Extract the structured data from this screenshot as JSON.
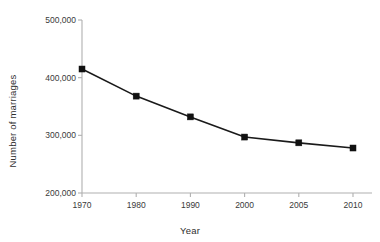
{
  "chart_data": {
    "type": "line",
    "title": "",
    "xlabel": "Year",
    "ylabel": "Number of marriages",
    "categories": [
      "1970",
      "1980",
      "1990",
      "2000",
      "2005",
      "2010"
    ],
    "values": [
      415000,
      368000,
      332000,
      297000,
      287000,
      278000
    ],
    "series": [
      {
        "name": "Number of marriages",
        "values": [
          415000,
          368000,
          332000,
          297000,
          287000,
          278000
        ]
      }
    ],
    "ylim": [
      200000,
      500000
    ],
    "yticks": [
      200000,
      300000,
      400000,
      500000
    ],
    "ytick_labels": [
      "200,000",
      "300,000",
      "400,000",
      "500,000"
    ],
    "xtick_labels": [
      "1970",
      "1980",
      "1990",
      "2000",
      "2005",
      "2010"
    ],
    "grid": false,
    "legend": false,
    "legend_position": "none",
    "marker": "square",
    "line_color": "#111111",
    "marker_color": "#111111",
    "axis_color": "#b0b0b0",
    "background_color": "#ffffff"
  },
  "axes": {
    "y_title": "Number of marriages",
    "x_title": "Year"
  }
}
